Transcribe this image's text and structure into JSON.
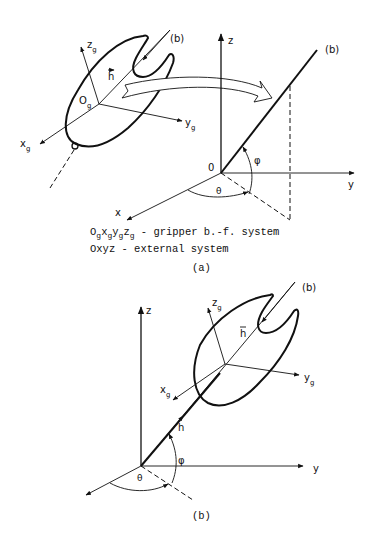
{
  "figure_a": {
    "panel_label": "(a)",
    "gripper_frame": {
      "origin_label": "O",
      "origin_sub": "g",
      "x_label": "x",
      "x_sub": "g",
      "y_label": "y",
      "y_sub": "g",
      "z_label": "z",
      "z_sub": "g",
      "vector_label": "h",
      "axis_b_label": "(b)"
    },
    "external_frame": {
      "origin_label": "0",
      "x_label": "x",
      "y_label": "y",
      "z_label": "z",
      "axis_b_label": "(b)",
      "phi_label": "φ",
      "theta_label": "θ"
    },
    "legend": {
      "line1_prefix": "O",
      "line1_rest": " - gripper b.-f. system",
      "line2": "Oxyz - external system"
    }
  },
  "figure_b": {
    "panel_label": "(b)",
    "axis_b_label": "(b)",
    "z_label": "z",
    "y_label": "y",
    "xg_label": "x",
    "xg_sub": "g",
    "yg_label": "y",
    "yg_sub": "g",
    "zg_label": "z",
    "zg_sub": "g",
    "vector_label": "h",
    "vector_label_2": "h",
    "phi_label": "φ",
    "theta_label": "θ"
  }
}
